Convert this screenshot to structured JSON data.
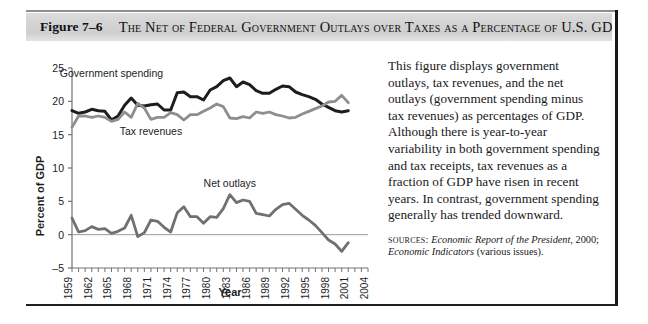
{
  "figure": {
    "number": "Figure 7–6",
    "title": "The Net of Federal Government Outlays over Taxes as a Percentage of U.S. GDP"
  },
  "caption": {
    "body": "This figure displays government outlays, tax revenues, and the net outlays (government spending minus tax revenues) as percentages of GDP. Although there is year-to-year variability in both government spending and tax receipts, tax revenues as a fraction of GDP have risen in recent years. In contrast, government spending generally has trended downward.",
    "sources_label": "sources:",
    "sources_italic_1": "Economic Report of the President,",
    "sources_plain_1": " 2000; ",
    "sources_italic_2": "Economic Indicators",
    "sources_plain_2": " (various issues)."
  },
  "chart_data": {
    "type": "line",
    "title": "",
    "xlabel": "Year",
    "ylabel": "Percent of GDP",
    "xlim": [
      1959,
      2004
    ],
    "ylim": [
      -5,
      25
    ],
    "yticks": [
      25,
      20,
      15,
      10,
      5,
      0,
      -5
    ],
    "xticks": [
      1959,
      1962,
      1965,
      1968,
      1971,
      1974,
      1977,
      1980,
      1983,
      1986,
      1989,
      1992,
      1995,
      1998,
      2001,
      2004
    ],
    "xtick_interval_minor": 1,
    "grid": false,
    "legend": "inline-annotations",
    "x": [
      1959,
      1960,
      1961,
      1962,
      1963,
      1964,
      1965,
      1966,
      1967,
      1968,
      1969,
      1970,
      1971,
      1972,
      1973,
      1974,
      1975,
      1976,
      1977,
      1978,
      1979,
      1980,
      1981,
      1982,
      1983,
      1984,
      1985,
      1986,
      1987,
      1988,
      1989,
      1990,
      1991,
      1992,
      1993,
      1994,
      1995,
      1996,
      1997,
      1998,
      1999,
      2000,
      2001
    ],
    "series": [
      {
        "name": "Government spending",
        "color": "#1b1d1f",
        "label_x": 1965,
        "label_y": 23.6,
        "values": [
          18.6,
          18.2,
          18.4,
          18.8,
          18.6,
          18.5,
          17.2,
          17.8,
          19.4,
          20.5,
          19.4,
          19.3,
          19.5,
          19.6,
          18.7,
          18.7,
          21.3,
          21.4,
          20.7,
          20.7,
          20.2,
          21.7,
          22.2,
          23.1,
          23.5,
          22.2,
          22.9,
          22.5,
          21.6,
          21.2,
          21.2,
          21.8,
          22.3,
          22.2,
          21.4,
          21.0,
          20.7,
          20.3,
          19.6,
          19.1,
          18.6,
          18.4,
          18.6
        ]
      },
      {
        "name": "Tax revenues",
        "color": "#8c8f92",
        "label_x": 1971,
        "label_y": 14.9,
        "values": [
          16.1,
          17.8,
          17.8,
          17.6,
          17.8,
          17.6,
          17.0,
          17.3,
          18.4,
          17.6,
          19.7,
          19.0,
          17.3,
          17.6,
          17.6,
          18.3,
          18.0,
          17.2,
          18.0,
          18.0,
          18.5,
          19.0,
          19.6,
          19.2,
          17.5,
          17.4,
          17.7,
          17.5,
          18.4,
          18.2,
          18.4,
          18.0,
          17.8,
          17.5,
          17.6,
          18.1,
          18.5,
          18.9,
          19.3,
          19.9,
          20.0,
          20.9,
          19.8
        ]
      },
      {
        "name": "Net outlays",
        "color": "#6e7174",
        "label_x": 1983,
        "label_y": 7.1,
        "values": [
          2.5,
          0.4,
          0.6,
          1.2,
          0.8,
          0.9,
          0.2,
          0.5,
          1.0,
          2.9,
          -0.3,
          0.3,
          2.2,
          2.0,
          1.1,
          0.4,
          3.3,
          4.2,
          2.7,
          2.7,
          1.7,
          2.7,
          2.6,
          3.9,
          6.0,
          4.8,
          5.2,
          5.0,
          3.2,
          3.0,
          2.8,
          3.8,
          4.5,
          4.7,
          3.8,
          2.9,
          2.2,
          1.4,
          0.3,
          -0.8,
          -1.4,
          -2.5,
          -1.2
        ]
      }
    ],
    "zero_line": 0
  }
}
